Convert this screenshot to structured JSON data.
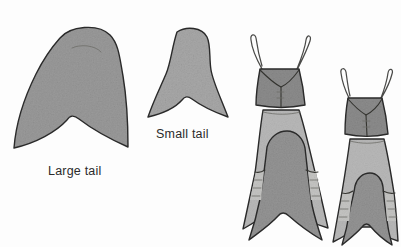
{
  "figure": {
    "background_color": "#fdfdfd",
    "ink_color": "#2a2a2a",
    "kind": "grayscale line-and-wash scientific illustration",
    "labels": {
      "large_tail": "Large tail",
      "small_tail": "Small tail"
    },
    "palette": {
      "tail_large_fill": "#9a9a9a",
      "tail_small_fill": "#a8a8a8",
      "head_fill": "#8c8c8c",
      "abdomen_fill": "#b8b8b8",
      "inner_tail_fill": "#949494",
      "segment_fill": "#c4c4c2",
      "outline": "#2a2a2a"
    },
    "panels": [
      {
        "id": "panel-large-tail",
        "name": "large-tail-shape",
        "label": "Large tail",
        "description": "Isolated broad forked tail fin, bell-shaped upper lobe with deeply notched bilobed trailing edge",
        "fill": "#9a9a9a",
        "bbox": [
          13,
          25,
          128,
          148
        ]
      },
      {
        "id": "panel-small-tail",
        "name": "small-tail-shape",
        "label": "Small tail",
        "description": "Isolated narrow forked tail fin, slimmer lobe and shallower fork",
        "fill": "#a8a8a8",
        "bbox": [
          147,
          28,
          228,
          118
        ]
      },
      {
        "id": "panel-body-large",
        "name": "specimen-body-large-tail",
        "label": "",
        "description": "Whole specimen in dorsal view: two curved antennae, dark trapezoidal head/thorax, pale abdomen with lateral segments, terminating in a large forked tail",
        "fill": "#b8b8b8",
        "bbox": [
          243,
          28,
          330,
          240
        ]
      },
      {
        "id": "panel-body-small",
        "name": "specimen-body-small-tail",
        "label": "",
        "description": "Whole specimen in dorsal view, smaller: two curved antennae, dark trapezoidal head/thorax, pale abdomen with lateral segments, terminating in a small forked tail",
        "fill": "#b8b8b8",
        "bbox": [
          330,
          58,
          398,
          244
        ]
      }
    ]
  }
}
